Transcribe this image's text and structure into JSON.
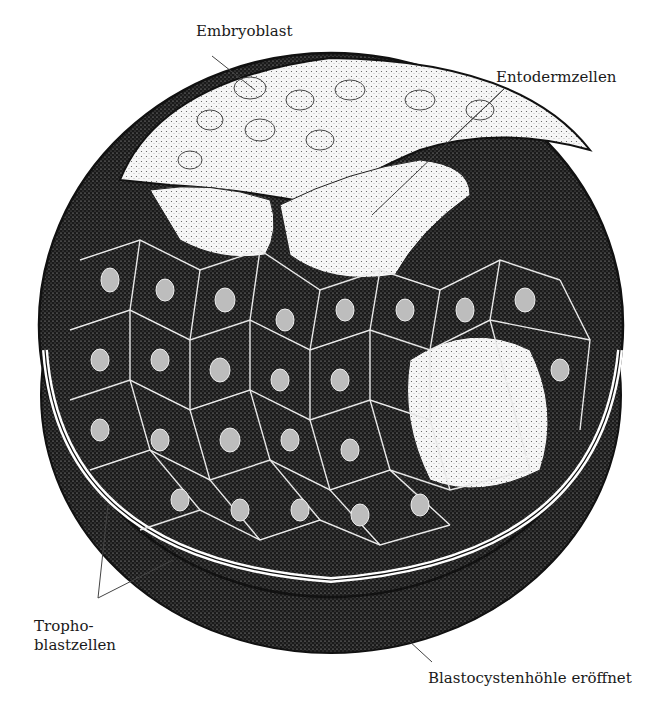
{
  "figure": {
    "labels": {
      "embryoblast": "Embryoblast",
      "entodermzellen": "Entodermzellen",
      "trophoblastzellen_line1": "Tropho-",
      "trophoblastzellen_line2": "blastzellen",
      "blastocystenhoehle": "Blastocystenhöhle eröffnet"
    },
    "colors": {
      "ink": "#111111",
      "cell_dark": "#1e1e1e",
      "cell_light": "#f2f2f2",
      "leader": "#444444"
    }
  }
}
